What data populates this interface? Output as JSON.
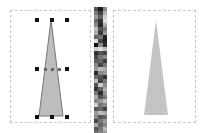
{
  "canvas": {
    "left_panel": {
      "shape": "triangle",
      "selected": true,
      "fill": "#bdbdbd",
      "stroke": "#777777"
    },
    "right_panel": {
      "shape": "triangle",
      "selected": false,
      "fill": "#c4c4c4"
    }
  },
  "palette": {
    "colors": [
      "#555",
      "#1a1a1a",
      "#8a8a8a",
      "#7a7a7a",
      "#444",
      "#b0b0b0",
      "#999",
      "#666",
      "#d0d0d0",
      "#6a6a6a",
      "#333",
      "#e0e0e0",
      "#888",
      "#2a2a2a",
      "#aaa",
      "#bbb",
      "#555",
      "#777",
      "#aaa",
      "#3a3a3a",
      "#999",
      "#666",
      "#777",
      "#222",
      "#ddd",
      "#444",
      "#1e1e1e",
      "#111",
      "#888",
      "#2b2b2b",
      "#ccc",
      "#ddd",
      "#bbb",
      "#333",
      "#555",
      "#444",
      "#4a4a4a",
      "#777",
      "#888",
      "#5a5a5a",
      "#666",
      "#3a3a3a",
      "#888",
      "#444",
      "#777",
      "#999",
      "#bbb",
      "#aaa",
      "#2a2a2a",
      "#888",
      "#999",
      "#6a6a6a",
      "#555",
      "#333",
      "#bbb",
      "#444",
      "#777",
      "#555",
      "#ccc",
      "#888",
      "#333",
      "#666",
      "#aaa",
      "#777",
      "#2a2a2a",
      "#999",
      "#aaa",
      "#555",
      "#777",
      "#888",
      "#999",
      "#bbb",
      "#ccc",
      "#777",
      "#888",
      "#555",
      "#666",
      "#444",
      "#999",
      "#bbb",
      "#aaa",
      "#888",
      "#555",
      "#666",
      "#444",
      "#777",
      "#999",
      "#aaa",
      "#666",
      "#888",
      "#555",
      "#777",
      "#bbb",
      "#777",
      "#888",
      "#999",
      "#666",
      "#aaa",
      "#ccc",
      "#888",
      "#777",
      "#666",
      "#999",
      "#bbb",
      "#aaa",
      "#666",
      "#888",
      "#777",
      "#777",
      "#999",
      "#aaa"
    ]
  }
}
